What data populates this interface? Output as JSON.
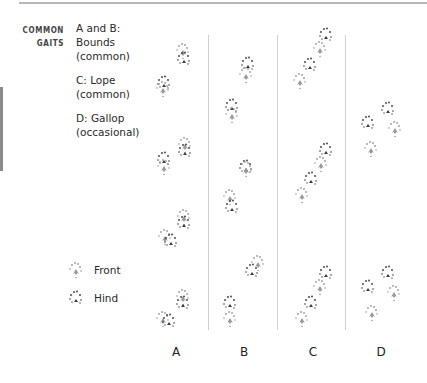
{
  "header": {
    "section_label_line1": "COMMON",
    "section_label_line2": "GAITS"
  },
  "gaits": [
    {
      "line1": "A and B:",
      "line2": "Bounds",
      "line3": "(common)"
    },
    {
      "line1": "C: Lope",
      "line2": "(common)"
    },
    {
      "line1": "D: Gallop",
      "line2": "(occasional)"
    }
  ],
  "legend": {
    "front_label": "Front",
    "hind_label": "Hind",
    "front_color": "#9a9a9a",
    "hind_color": "#3a3a3a"
  },
  "columns": [
    {
      "label": "A"
    },
    {
      "label": "B"
    },
    {
      "label": "C"
    },
    {
      "label": "D"
    }
  ],
  "colors": {
    "rule": "#b8b8b8",
    "divider": "#cfcfcf",
    "side_bar": "#8a8a8a"
  }
}
